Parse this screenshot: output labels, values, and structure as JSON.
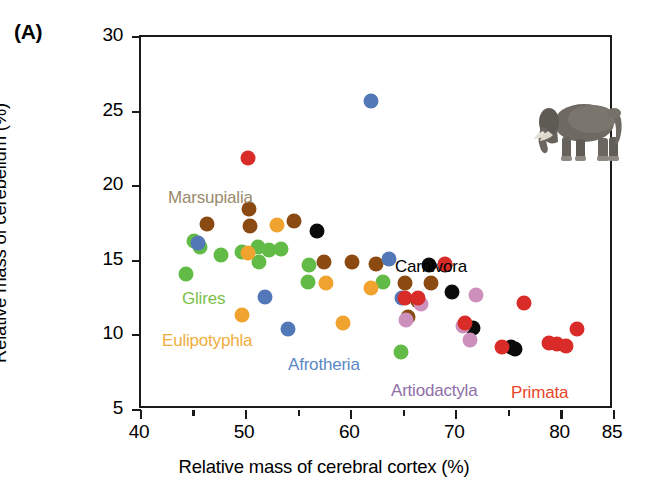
{
  "figure": {
    "panel_label": "(A)",
    "caption_group_labels_note": "mammalian taxonomic orders"
  },
  "axes": {
    "x": {
      "title": "Relative mass of cerebral cortex (%)",
      "min": 40,
      "max": 85,
      "major_ticks": [
        40,
        50,
        60,
        70,
        80,
        85
      ],
      "minor_ticks": [
        45,
        55,
        65,
        75
      ],
      "tick_labels": [
        "40",
        "50",
        "60",
        "70",
        "80",
        "85"
      ]
    },
    "y": {
      "title": "Relative mass of cerebellum (%)",
      "min": 5,
      "max": 30,
      "major_ticks": [
        5,
        10,
        15,
        20,
        25,
        30
      ],
      "minor_ticks": [],
      "tick_labels": [
        "5",
        "10",
        "15",
        "20",
        "25",
        "30"
      ]
    }
  },
  "group_labels": [
    {
      "name": "Marsupialia",
      "text": "Marsupialia",
      "color": "#9a8a6b",
      "x": 166,
      "y": 186
    },
    {
      "name": "Glires",
      "text": "Glires",
      "color": "#7cc04a",
      "x": 180,
      "y": 287
    },
    {
      "name": "Eulipotyphla",
      "text": "Eulipotyphla",
      "color": "#f0ad3e",
      "x": 160,
      "y": 329
    },
    {
      "name": "Afrotheria",
      "text": "Afrotheria",
      "color": "#5b87c5",
      "x": 286,
      "y": 353
    },
    {
      "name": "Carnivora",
      "text": "Carnivora",
      "color": "#000000",
      "x": 393,
      "y": 255
    },
    {
      "name": "Artiodactyla",
      "text": "Artiodactyla",
      "color": "#8f6fa8",
      "x": 389,
      "y": 379
    },
    {
      "name": "Primata",
      "text": "Primata",
      "color": "#e8452c",
      "x": 509,
      "y": 381
    }
  ],
  "insets": [
    {
      "name": "elephant-photo",
      "label": "African elephant",
      "x": 381,
      "y": 56,
      "w": 118,
      "h": 78
    },
    {
      "name": "human-photo",
      "label": "Human male and female",
      "x": 541,
      "y": 236,
      "w": 72,
      "h": 86
    }
  ],
  "colors": {
    "marsupialia": "#8a4a12",
    "glires": "#62bb46",
    "eulipotyphla": "#f0a32e",
    "afrotheria": "#5278b8",
    "carnivora": "#0b0b0b",
    "artiodactyla": "#cd90bc",
    "primata": "#d92b28",
    "axis": "#1a1a1a"
  },
  "chart_data": {
    "type": "scatter",
    "title": "",
    "xlabel": "Relative mass of cerebral cortex (%)",
    "ylabel": "Relative mass of cerebellum (%)",
    "xlim": [
      40,
      85
    ],
    "ylim": [
      5,
      30
    ],
    "grid": false,
    "legend": "inline annotations placed near each group's point cluster",
    "point_diameter_px": 15,
    "series": [
      {
        "name": "Marsupialia",
        "color": "#8a4a12",
        "points": [
          [
            46.3,
            17.5
          ],
          [
            50.3,
            18.5
          ],
          [
            50.4,
            17.3
          ],
          [
            54.6,
            17.7
          ],
          [
            57.4,
            14.9
          ],
          [
            60.1,
            14.9
          ],
          [
            62.4,
            14.8
          ],
          [
            65.1,
            13.5
          ],
          [
            67.6,
            13.5
          ],
          [
            66.4,
            12.3
          ],
          [
            65.4,
            11.2
          ]
        ]
      },
      {
        "name": "Glires",
        "color": "#62bb46",
        "points": [
          [
            45.0,
            16.3
          ],
          [
            45.6,
            15.9
          ],
          [
            44.3,
            14.1
          ],
          [
            47.6,
            15.4
          ],
          [
            49.6,
            15.6
          ],
          [
            51.1,
            15.9
          ],
          [
            52.2,
            15.7
          ],
          [
            53.3,
            15.8
          ],
          [
            51.2,
            14.9
          ],
          [
            56.0,
            14.7
          ],
          [
            55.9,
            13.6
          ],
          [
            63.0,
            13.6
          ],
          [
            64.7,
            8.9
          ]
        ]
      },
      {
        "name": "Eulipotyphla",
        "color": "#f0a32e",
        "points": [
          [
            50.2,
            15.5
          ],
          [
            52.9,
            17.4
          ],
          [
            49.6,
            11.4
          ],
          [
            57.6,
            13.5
          ],
          [
            59.2,
            10.8
          ],
          [
            61.9,
            13.2
          ]
        ]
      },
      {
        "name": "Afrotheria",
        "color": "#5278b8",
        "points": [
          [
            45.4,
            16.2
          ],
          [
            51.8,
            12.6
          ],
          [
            54.0,
            10.4
          ],
          [
            61.9,
            25.7
          ],
          [
            63.6,
            15.1
          ],
          [
            64.8,
            12.5
          ]
        ]
      },
      {
        "name": "Carnivora",
        "color": "#0b0b0b",
        "points": [
          [
            56.7,
            17.0
          ],
          [
            67.4,
            14.7
          ],
          [
            68.9,
            14.7
          ],
          [
            69.6,
            12.9
          ],
          [
            71.6,
            10.5
          ],
          [
            75.2,
            9.2
          ],
          [
            75.6,
            9.1
          ]
        ]
      },
      {
        "name": "Artiodactyla",
        "color": "#cd90bc",
        "points": [
          [
            65.2,
            11.0
          ],
          [
            66.6,
            12.1
          ],
          [
            70.6,
            10.6
          ],
          [
            71.3,
            9.7
          ],
          [
            71.9,
            12.7
          ]
        ]
      },
      {
        "name": "Primata",
        "color": "#d92b28",
        "points": [
          [
            50.2,
            21.9
          ],
          [
            65.1,
            12.5
          ],
          [
            66.4,
            12.5
          ],
          [
            68.9,
            14.8
          ],
          [
            70.8,
            10.8
          ],
          [
            74.3,
            9.2
          ],
          [
            76.4,
            12.2
          ],
          [
            78.8,
            9.5
          ],
          [
            79.6,
            9.4
          ],
          [
            80.4,
            9.3
          ],
          [
            81.5,
            10.4
          ]
        ]
      }
    ]
  }
}
